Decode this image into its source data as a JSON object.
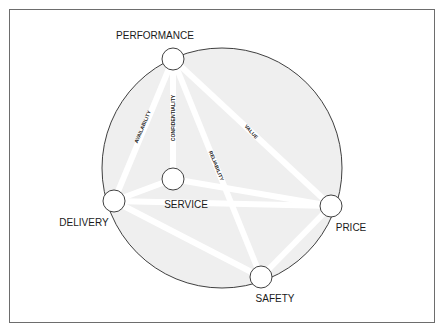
{
  "diagram": {
    "colors": {
      "frame": "#6d6d6d",
      "circle_fill": "#efefef",
      "circle_stroke": "#2a2a2a",
      "edge": "#ffffff",
      "node_fill": "#ffffff",
      "text": "#1a1a1a"
    },
    "outer_circle": {
      "cx": 222,
      "cy": 168,
      "r": 120
    },
    "nodes": [
      {
        "id": "performance",
        "label": "PERFORMANCE",
        "cx": 173,
        "cy": 59,
        "r": 11,
        "label_x": 155,
        "label_y": 39
      },
      {
        "id": "service",
        "label": "SERVICE",
        "cx": 173,
        "cy": 179,
        "r": 11,
        "label_x": 186,
        "label_y": 208
      },
      {
        "id": "delivery",
        "label": "DELIVERY",
        "cx": 114,
        "cy": 201,
        "r": 11,
        "label_x": 84,
        "label_y": 226
      },
      {
        "id": "price",
        "label": "PRICE",
        "cx": 331,
        "cy": 206,
        "r": 11,
        "label_x": 351,
        "label_y": 231
      },
      {
        "id": "safety",
        "label": "SAFETY",
        "cx": 261,
        "cy": 277,
        "r": 11,
        "label_x": 275,
        "label_y": 302
      }
    ],
    "edges": [
      {
        "from": "performance",
        "to": "delivery",
        "label": "AVAILABILITY",
        "label_x": 143,
        "label_y": 127,
        "angle": -67
      },
      {
        "from": "performance",
        "to": "service",
        "label": "CONFIDENTIALITY",
        "label_x": 174,
        "label_y": 118,
        "angle": -90
      },
      {
        "from": "performance",
        "to": "safety",
        "label": "RELIABILITY",
        "label_x": 216,
        "label_y": 166,
        "angle": 68
      },
      {
        "from": "performance",
        "to": "price",
        "label": "VALUE",
        "label_x": 251,
        "label_y": 132,
        "angle": 48
      },
      {
        "from": "delivery",
        "to": "service",
        "label": "",
        "label_x": 0,
        "label_y": 0,
        "angle": 0
      },
      {
        "from": "delivery",
        "to": "price",
        "label": "",
        "label_x": 0,
        "label_y": 0,
        "angle": 0
      },
      {
        "from": "delivery",
        "to": "safety",
        "label": "",
        "label_x": 0,
        "label_y": 0,
        "angle": 0
      },
      {
        "from": "service",
        "to": "price",
        "label": "",
        "label_x": 0,
        "label_y": 0,
        "angle": 0
      },
      {
        "from": "price",
        "to": "safety",
        "label": "",
        "label_x": 0,
        "label_y": 0,
        "angle": 0
      }
    ]
  }
}
